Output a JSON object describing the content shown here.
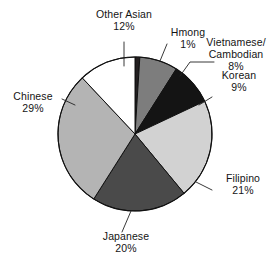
{
  "chart_data": {
    "type": "pie",
    "title": "",
    "subtitle": "",
    "xlabel": "",
    "ylabel": "",
    "legend_position": "none",
    "grid": false,
    "value_unit": "percent",
    "start_angle_deg": 0,
    "direction": "clockwise",
    "categories": [
      "Hmong",
      "Vietnamese/ Cambodian",
      "Korean",
      "Filipino",
      "Japanese",
      "Chinese",
      "Other Asian"
    ],
    "values": [
      1,
      8,
      9,
      21,
      20,
      29,
      12
    ],
    "slices": [
      {
        "name": "hmong",
        "label_line1": "Hmong",
        "label_line2": "1%",
        "value": 1,
        "value_text": "1%",
        "color": "#231f20",
        "start_deg": 0,
        "end_deg": 3.6
      },
      {
        "name": "vietnamese-cambodian",
        "label_line1": "Vietnamese/",
        "label_line2": "Cambodian",
        "label_line3": "8%",
        "value": 8,
        "value_text": "8%",
        "color": "#7d7d7d",
        "start_deg": 3.6,
        "end_deg": 32.4
      },
      {
        "name": "korean",
        "label_line1": "Korean",
        "label_line2": "9%",
        "value": 9,
        "value_text": "9%",
        "color": "#141414",
        "start_deg": 32.4,
        "end_deg": 64.8
      },
      {
        "name": "filipino",
        "label_line1": "Filipino",
        "label_line2": "21%",
        "value": 21,
        "value_text": "21%",
        "color": "#d2d2d2",
        "start_deg": 64.8,
        "end_deg": 140.4
      },
      {
        "name": "japanese",
        "label_line1": "Japanese",
        "label_line2": "20%",
        "value": 20,
        "value_text": "20%",
        "color": "#4a4a4a",
        "start_deg": 140.4,
        "end_deg": 212.4
      },
      {
        "name": "chinese",
        "label_line1": "Chinese",
        "label_line2": "29%",
        "value": 29,
        "value_text": "29%",
        "color": "#b4b4b4",
        "start_deg": 212.4,
        "end_deg": 316.8
      },
      {
        "name": "other-asian",
        "label_line1": "Other Asian",
        "label_line2": "12%",
        "value": 12,
        "value_text": "12%",
        "color": "#ffffff",
        "start_deg": 316.8,
        "end_deg": 360
      }
    ],
    "colors": {
      "outline": "#111111",
      "leader_line": "#222222",
      "text": "#141414",
      "background": "#ffffff"
    }
  }
}
